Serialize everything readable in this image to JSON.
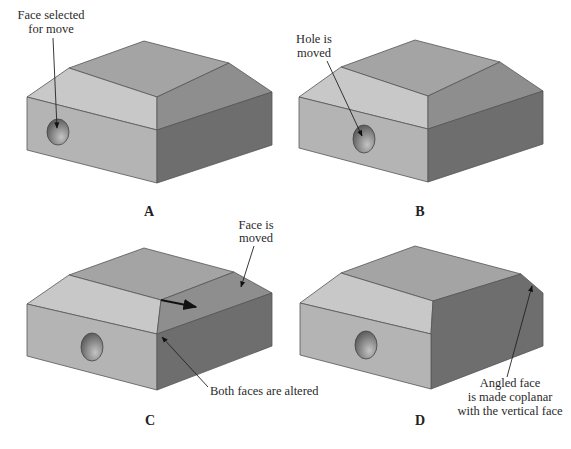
{
  "figure": {
    "panels": [
      {
        "id": "A",
        "caption": "A",
        "callouts": [
          {
            "lines": [
              "Face selected",
              "for move"
            ]
          }
        ]
      },
      {
        "id": "B",
        "caption": "B",
        "callouts": [
          {
            "lines": [
              "Hole is",
              "moved"
            ]
          }
        ]
      },
      {
        "id": "C",
        "caption": "C",
        "callouts": [
          {
            "lines": [
              "Face is",
              "moved"
            ]
          },
          {
            "lines": [
              "Both faces are altered"
            ]
          }
        ]
      },
      {
        "id": "D",
        "caption": "D",
        "callouts": [
          {
            "lines": [
              "Angled face",
              "is made coplanar",
              "with the vertical face"
            ]
          }
        ]
      }
    ],
    "colors": {
      "top": "#a4a4a4",
      "left_chamfer": "#c8c8c8",
      "right_chamfer": "#8e8e8e",
      "front": "#b4b4b4",
      "side": "#6e6e6e",
      "hole_dark": "#555555",
      "hole_light": "#bcbcbc",
      "arrow": "#111111"
    }
  }
}
